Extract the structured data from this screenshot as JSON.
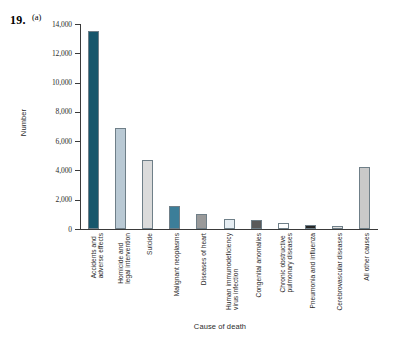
{
  "figure": {
    "problem_number": "19.",
    "part_label": "(a)"
  },
  "chart_data": {
    "type": "bar",
    "title": "",
    "xlabel": "Cause of death",
    "ylabel": "Number",
    "ylim": [
      0,
      14000
    ],
    "ytick_labels": [
      "14,000",
      "12,000",
      "10,000",
      "8,000",
      "6,000",
      "4,000",
      "2,000",
      "0"
    ],
    "yticks": [
      14000,
      12000,
      10000,
      8000,
      6000,
      4000,
      2000,
      0
    ],
    "grid": false,
    "legend": "none",
    "categories": [
      "Accidents and\nadverse effects",
      "Homicide and\nlegal intervention",
      "Suicide",
      "Malignant neoplasms",
      "Diseases of heart",
      "Human immunodeficiency\nvirus infection",
      "Congenital anomalies",
      "Chronic obstructive\npulmonary diseases",
      "Pneumonia and influenza",
      "Cerebrovascular diseases",
      "All other causes"
    ],
    "values": [
      13500,
      6900,
      4700,
      1550,
      1050,
      700,
      620,
      400,
      250,
      180,
      4250
    ],
    "bar_colors": [
      "#17566b",
      "#b9c9d4",
      "#dbdbdb",
      "#3c7e99",
      "#9a9a9a",
      "#e7eef3",
      "#5a5a5a",
      "#ffffff",
      "#262626",
      "#e0e0e0",
      "#c9c9c9"
    ],
    "bar_border_color": "#6f7f88"
  }
}
